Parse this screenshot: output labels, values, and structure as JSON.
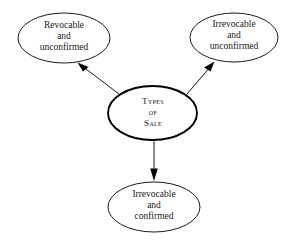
{
  "diagram": {
    "title": "Types of Sale",
    "background_color": "#ffffff",
    "stroke_color": "#000000",
    "text_color": "#1a1a1a",
    "nodes": {
      "center": {
        "id": "types-of-sale",
        "lines": [
          "Types",
          "of",
          "Sale"
        ],
        "line1": "Types",
        "line2": "of",
        "line3": "Sale",
        "shape": "ellipse",
        "emphasis": "bold-outline"
      },
      "top_left": {
        "id": "revocable-and-unconfirmed",
        "lines": [
          "Revocable",
          "and",
          "unconfirmed"
        ],
        "line1": "Revocable",
        "line2": "and",
        "line3": "unconfirmed",
        "shape": "ellipse"
      },
      "top_right": {
        "id": "irrevocable-and-unconfirmed",
        "lines": [
          "Irrevocable",
          "and",
          "unconfirmed"
        ],
        "line1": "Irrevocable",
        "line2": "and",
        "line3": "unconfirmed",
        "shape": "ellipse"
      },
      "bottom": {
        "id": "irrevocable-and-confirmed",
        "lines": [
          "Irrevocable",
          "and",
          "confirmed"
        ],
        "line1": "Irrevocable",
        "line2": "and",
        "line3": "confirmed",
        "shape": "ellipse"
      }
    },
    "edges": [
      {
        "id": "center-to-top-left",
        "from": "types-of-sale",
        "to": "revocable-and-unconfirmed",
        "direction": "up-left",
        "arrowhead": "filled-triangle"
      },
      {
        "id": "center-to-top-right",
        "from": "types-of-sale",
        "to": "irrevocable-and-unconfirmed",
        "direction": "up-right",
        "arrowhead": "filled-triangle"
      },
      {
        "id": "center-to-bottom",
        "from": "types-of-sale",
        "to": "irrevocable-and-confirmed",
        "direction": "down",
        "arrowhead": "filled-triangle"
      }
    ]
  }
}
